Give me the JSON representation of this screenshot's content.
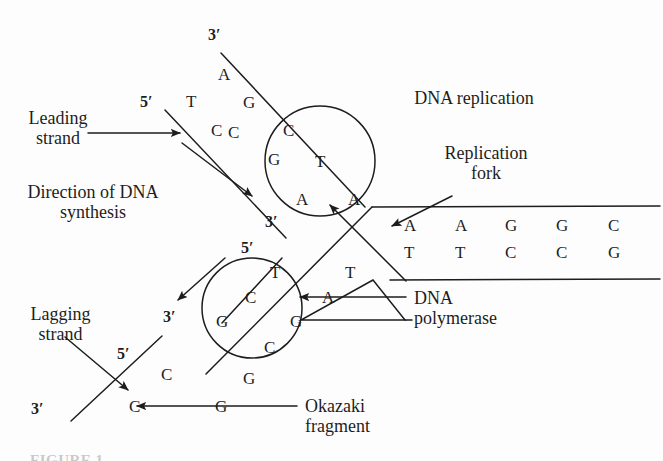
{
  "figure": {
    "title": "DNA replication",
    "caption_partial": "FIGURE 1"
  },
  "labels": {
    "leading_strand": "Leading\nstrand",
    "direction_synthesis": "Direction of DNA\nsynthesis",
    "lagging_strand": "Lagging\nstrand",
    "replication_fork": "Replication\nfork",
    "dna_polymerase": "DNA\npolymerase",
    "okazaki_fragment": "Okazaki\nfragment"
  },
  "primes": {
    "template_top_3": "3′",
    "leading_5": "5′",
    "leading_3": "3′",
    "lagging_fork_5": "5′",
    "lagging_mid_3": "3′",
    "okazaki_5": "5′",
    "okazaki_3": "3′"
  },
  "leading_region": {
    "template_letters": [
      "A",
      "G",
      "C"
    ],
    "new_strand_letters": [
      "T",
      "C"
    ],
    "bubble_letters": [
      "C",
      "G",
      "T",
      "A",
      "A"
    ]
  },
  "lagging_region": {
    "bubble_letters": [
      "T",
      "C",
      "G",
      "G",
      "C",
      "G"
    ],
    "polymerase_letters": [
      "A",
      "T"
    ],
    "okazaki_letters": [
      "C",
      "C",
      "G"
    ]
  },
  "duplex": {
    "top_strand": [
      "A",
      "A",
      "G",
      "G",
      "C"
    ],
    "bottom_strand": [
      "T",
      "T",
      "C",
      "C",
      "G"
    ]
  },
  "colors": {
    "ink": "#1d1d1d",
    "paper": "#fdfdfd"
  }
}
